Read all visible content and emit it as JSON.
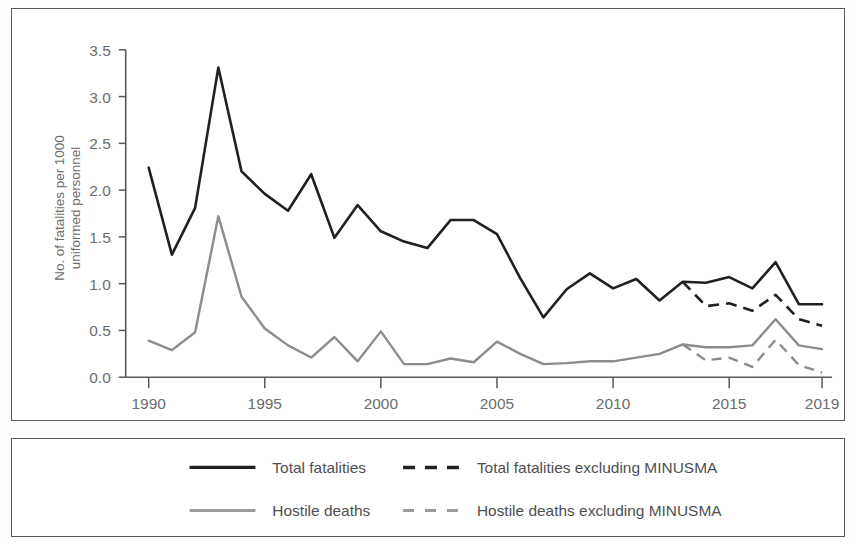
{
  "chart_data": {
    "type": "line",
    "title": "",
    "xlabel": "",
    "ylabel": "No. of fatalities per 1000 uniformed personnel",
    "xlim": [
      1990,
      2019
    ],
    "ylim": [
      0.0,
      3.5
    ],
    "grid": false,
    "legend_position": "bottom",
    "x": [
      1990,
      1991,
      1992,
      1993,
      1994,
      1995,
      1996,
      1997,
      1998,
      1999,
      2000,
      2001,
      2002,
      2003,
      2004,
      2005,
      2006,
      2007,
      2008,
      2009,
      2010,
      2011,
      2012,
      2013,
      2014,
      2015,
      2016,
      2017,
      2018,
      2019
    ],
    "xticks": [
      1990,
      1995,
      2000,
      2005,
      2010,
      2015,
      2019
    ],
    "xticklabels": [
      "1990",
      "1995",
      "2000",
      "2005",
      "2010",
      "2015",
      "2019"
    ],
    "yticks": [
      0.0,
      0.5,
      1.0,
      1.5,
      2.0,
      2.5,
      3.0,
      3.5
    ],
    "yticklabels": [
      "0.0",
      "0.5",
      "1.0",
      "1.5",
      "2.0",
      "2.5",
      "3.0",
      "3.5"
    ],
    "series": [
      {
        "name": "Total fatalities",
        "style": "solid",
        "color": "#221f20",
        "x": [
          1990,
          1991,
          1992,
          1993,
          1994,
          1995,
          1996,
          1997,
          1998,
          1999,
          2000,
          2001,
          2002,
          2003,
          2004,
          2005,
          2006,
          2007,
          2008,
          2009,
          2010,
          2011,
          2012,
          2013,
          2014,
          2015,
          2016,
          2017,
          2018,
          2019
        ],
        "values": [
          2.24,
          1.31,
          1.81,
          3.31,
          2.2,
          1.96,
          1.78,
          2.17,
          1.49,
          1.84,
          1.56,
          1.45,
          1.38,
          1.68,
          1.68,
          1.53,
          1.06,
          0.64,
          0.94,
          1.11,
          0.95,
          1.05,
          0.82,
          1.02,
          1.01,
          1.07,
          0.95,
          1.23,
          0.78,
          0.78
        ]
      },
      {
        "name": "Hostile deaths",
        "style": "solid",
        "color": "#8b8c8e",
        "x": [
          1990,
          1991,
          1992,
          1993,
          1994,
          1995,
          1996,
          1997,
          1998,
          1999,
          2000,
          2001,
          2002,
          2003,
          2004,
          2005,
          2006,
          2007,
          2008,
          2009,
          2010,
          2011,
          2012,
          2013,
          2014,
          2015,
          2016,
          2017,
          2018,
          2019
        ],
        "values": [
          0.39,
          0.29,
          0.48,
          1.72,
          0.86,
          0.52,
          0.34,
          0.21,
          0.43,
          0.17,
          0.49,
          0.14,
          0.14,
          0.2,
          0.16,
          0.38,
          0.25,
          0.14,
          0.15,
          0.17,
          0.17,
          0.21,
          0.25,
          0.35,
          0.32,
          0.32,
          0.34,
          0.62,
          0.34,
          0.3
        ]
      },
      {
        "name": "Total fatalities excluding MINUSMA",
        "style": "dashed",
        "color": "#221f20",
        "x": [
          2013,
          2014,
          2015,
          2016,
          2017,
          2018,
          2019
        ],
        "values": [
          1.02,
          0.76,
          0.79,
          0.71,
          0.88,
          0.62,
          0.55
        ]
      },
      {
        "name": "Hostile deaths excluding MINUSMA",
        "style": "dashed",
        "color": "#8b8c8e",
        "x": [
          2013,
          2014,
          2015,
          2016,
          2017,
          2018,
          2019
        ],
        "values": [
          0.35,
          0.18,
          0.21,
          0.11,
          0.4,
          0.13,
          0.05
        ]
      }
    ]
  },
  "axis": {
    "ylabel_line1": "No. of fatalities per 1000",
    "ylabel_line2": "uniformed personnel"
  },
  "legend": {
    "items": [
      {
        "label": "Total fatalities",
        "style": "solid",
        "color": "#221f20"
      },
      {
        "label": "Total fatalities excluding MINUSMA",
        "style": "dashed",
        "color": "#221f20"
      },
      {
        "label": "Hostile deaths",
        "style": "solid",
        "color": "#9a9b9d"
      },
      {
        "label": "Hostile deaths excluding MINUSMA",
        "style": "dashed",
        "color": "#9a9b9d"
      }
    ]
  },
  "colors": {
    "total": "#221f20",
    "hostile": "#8b8c8e",
    "axis": "#58595b",
    "text": "#6b6c6e",
    "border": "#5a5a5a",
    "background": "#ffffff"
  }
}
